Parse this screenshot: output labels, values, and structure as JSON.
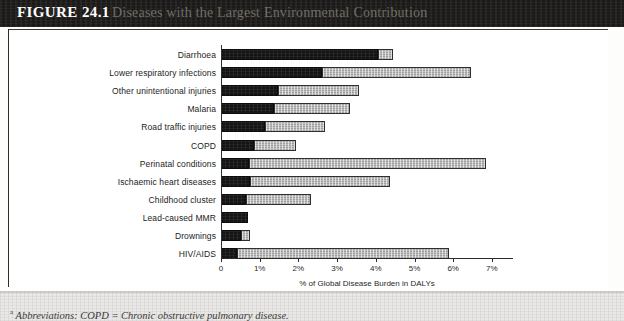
{
  "figure": {
    "number": "FIGURE 24.1",
    "title": "Diseases with the Largest Environmental Contribution",
    "footnote_marker": "a",
    "footnote": "Abbreviations: COPD = Chronic obstructive pulmonary disease."
  },
  "colors": {
    "header_band": "#1b1a18",
    "environmental_segment": "#141414",
    "nonenvironmental_segment": "#b7b7b7",
    "panel_background": "#ffffff",
    "axis": "#2a2a2a"
  },
  "chart_data": {
    "type": "bar",
    "orientation": "horizontal",
    "stacked": true,
    "title": "Diseases with the Largest Environmental Contribution",
    "xlabel": "% of Global Disease Burden in DALYs",
    "ylabel": "",
    "xlim": [
      0,
      7.5
    ],
    "xticks": [
      0,
      1,
      2,
      3,
      4,
      5,
      6,
      7
    ],
    "xticklabels": [
      "0",
      "1%",
      "2%",
      "3%",
      "4%",
      "5%",
      "6%",
      "7%"
    ],
    "grid": false,
    "legend": "none",
    "categories": [
      "Diarrhoea",
      "Lower respiratory infections",
      "Other unintentional injuries",
      "Malaria",
      "Road traffic injuries",
      "COPD",
      "Perinatal conditions",
      "Ischaemic heart diseases",
      "Childhood cluster",
      "Lead-caused MMR",
      "Drownings",
      "HIV/AIDS"
    ],
    "series": [
      {
        "name": "Environmental contribution",
        "values": [
          4.05,
          2.6,
          1.47,
          1.37,
          1.14,
          0.85,
          0.72,
          0.75,
          0.65,
          0.7,
          0.52,
          0.42
        ]
      },
      {
        "name": "Non-environmental contribution",
        "values": [
          0.4,
          3.85,
          2.1,
          1.97,
          1.55,
          1.08,
          6.13,
          3.62,
          1.68,
          0.0,
          0.23,
          5.48
        ]
      }
    ],
    "totals": [
      4.45,
      6.45,
      3.57,
      3.34,
      2.69,
      1.93,
      6.85,
      4.37,
      2.33,
      0.7,
      0.75,
      5.9
    ]
  }
}
